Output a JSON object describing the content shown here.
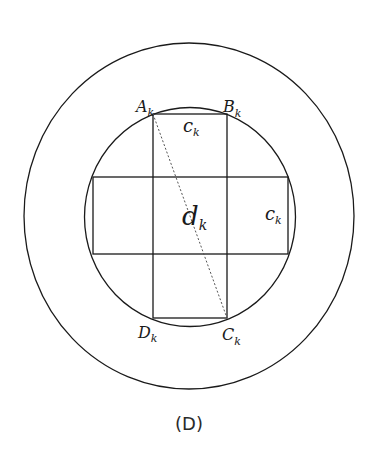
{
  "figure": {
    "caption": "(D)",
    "colors": {
      "stroke": "#1a1a1a",
      "dashed": "#555555",
      "background": "#ffffff"
    },
    "outer_circle": {
      "cx": 189,
      "cy": 216,
      "rx": 165,
      "ry": 173
    },
    "inner_circle": {
      "cx": 190,
      "cy": 217,
      "rx": 105.5,
      "ry": 109.5
    },
    "vertical_rect": {
      "x": 153,
      "y": 114,
      "w": 74,
      "h": 204
    },
    "horizontal_rect": {
      "x": 93,
      "y": 177,
      "w": 195,
      "h": 77
    },
    "diagonal": {
      "from": "A_k",
      "to": "C_k"
    },
    "labels": {
      "A": {
        "main": "A",
        "sub": "k"
      },
      "B": {
        "main": "B",
        "sub": "k"
      },
      "C": {
        "main": "C",
        "sub": "k"
      },
      "D": {
        "main": "D",
        "sub": "k"
      },
      "c_top": {
        "main": "c",
        "sub": "k"
      },
      "c_right": {
        "main": "c",
        "sub": "k"
      },
      "d_center": {
        "main": "d",
        "sub": "k"
      }
    }
  }
}
